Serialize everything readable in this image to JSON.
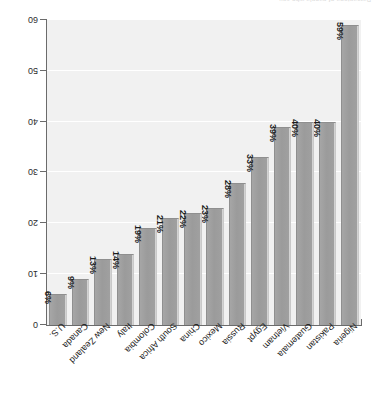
{
  "caption": {
    "text": "Percentage of people who say ..."
  },
  "chart_data": {
    "type": "bar",
    "title": "",
    "subtitle": "",
    "xlabel": "",
    "ylabel": "",
    "ylim": [
      0,
      60
    ],
    "yticks": [
      0,
      10,
      20,
      30,
      40,
      50,
      60
    ],
    "grid": true,
    "gridlines_at": [
      10,
      20,
      30,
      40,
      50
    ],
    "legend": false,
    "orientation": "vertical",
    "value_suffix": "%",
    "categories": [
      "Nigeria",
      "Pakistan",
      "Guatemala",
      "Vietnam",
      "Egypt",
      "Russia",
      "Mexico",
      "China",
      "South Africa",
      "Colombia",
      "Italy",
      "New Zealand",
      "Canada",
      "U.S."
    ],
    "values": [
      59,
      40,
      40,
      39,
      33,
      28,
      23,
      22,
      21,
      19,
      14,
      13,
      9,
      6
    ],
    "value_labels": [
      "59%",
      "40%",
      "40%",
      "39%",
      "33%",
      "28%",
      "23%",
      "22%",
      "21%",
      "19%",
      "14%",
      "13%",
      "9%",
      "6%"
    ],
    "tick_labels": [
      "0",
      "10",
      "20",
      "30",
      "40",
      "50",
      "60"
    ]
  },
  "colors": {
    "bar_fill": "#9b9b9b",
    "plot_background": "#f1f1f1",
    "gridline": "#ffffff",
    "axis": "#6b6b6b",
    "text": "#1b1b1b",
    "page_background": "#ffffff"
  }
}
